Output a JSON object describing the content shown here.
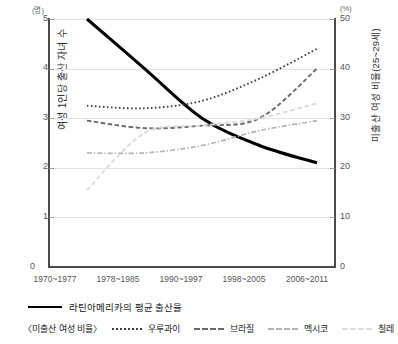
{
  "chart_data": {
    "type": "line",
    "title": "",
    "categories": [
      "1970~1977",
      "1978~1985",
      "1990~1997",
      "1998~2005",
      "2006~2011"
    ],
    "left_axis": {
      "label": "여성 1인당 출산 자녀 수",
      "unit": "(명)",
      "ticks": [
        "0",
        "1",
        "2",
        "3",
        "4",
        "5"
      ],
      "ylim": [
        0,
        5
      ]
    },
    "right_axis": {
      "label": "미출산 여성 비율(25~29세)",
      "unit": "(%)",
      "ticks": [
        "0",
        "10",
        "20",
        "30",
        "40",
        "50"
      ],
      "ylim": [
        0,
        50
      ]
    },
    "grid": true,
    "legend_position": "bottom",
    "series": [
      {
        "name": "라틴아메리카의 평균 출산율",
        "axis": "left",
        "style": "solid",
        "color": "#000000",
        "values": [
          5.0,
          4.0,
          3.0,
          2.45,
          2.1
        ]
      },
      {
        "name": "우루과이",
        "axis": "right",
        "style": "dotted",
        "color": "#3d3d3d",
        "values": [
          32.5,
          32.0,
          33.5,
          38.0,
          44.0
        ]
      },
      {
        "name": "브라질",
        "axis": "right",
        "style": "dashed",
        "color": "#6a6a6a",
        "values": [
          29.5,
          28.0,
          28.5,
          30.0,
          40.0
        ]
      },
      {
        "name": "멕시코",
        "axis": "right",
        "style": "dash-dot",
        "color": "#b4b4b4",
        "values": [
          23.0,
          23.0,
          24.5,
          27.5,
          29.5
        ]
      },
      {
        "name": "칠레",
        "axis": "right",
        "style": "light-dashed",
        "color": "#dcdcdc",
        "values": [
          15.5,
          27.0,
          28.5,
          30.0,
          33.0
        ]
      }
    ],
    "legend": {
      "primary_label": "라틴아메리카의 평균 출산율",
      "group_label": "〈미출산 여성 비율〉",
      "items": [
        "우루과이",
        "브라질",
        "멕시코",
        "칠레"
      ]
    }
  }
}
